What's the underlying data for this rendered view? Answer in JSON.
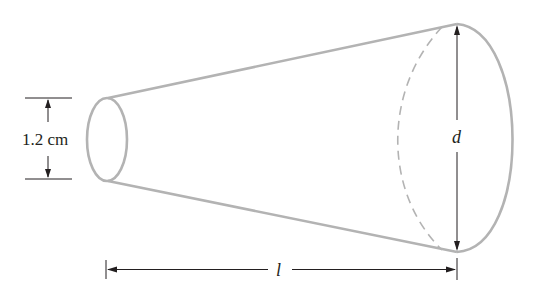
{
  "figure": {
    "shape": "truncated-cone",
    "labels": {
      "small_diameter": "1.2 cm",
      "large_diameter": "d",
      "length": "l"
    },
    "colors": {
      "outline": "#b3b3b3",
      "dimension_lines": "#231f20",
      "text": "#231f20"
    }
  }
}
